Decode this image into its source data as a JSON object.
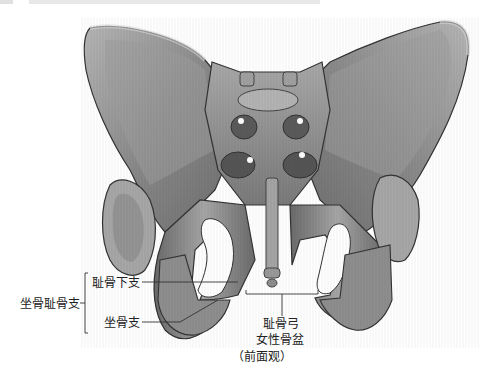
{
  "figure": {
    "title": "女性骨盆",
    "view": "（前面观）",
    "colors": {
      "bone_light": "#c9c9c9",
      "bone_mid": "#9a9a9a",
      "bone_dark": "#5e5e5e",
      "outline": "#333333",
      "leader_line": "#333333",
      "text": "#222222",
      "background": "#ffffff"
    }
  },
  "labels": {
    "group_label": "坐骨耻骨支",
    "inferior_pubic_ramus": "耻骨下支",
    "ischial_ramus": "坐骨支",
    "pubic_arch": "耻骨弓",
    "caption_title": "女性骨盆",
    "caption_view": "（前面观）"
  }
}
